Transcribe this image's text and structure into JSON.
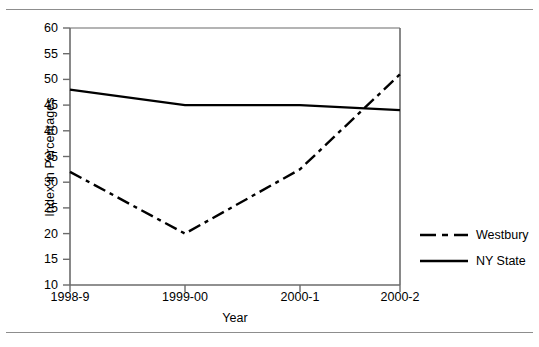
{
  "chart_data": {
    "type": "line",
    "title": "",
    "xlabel": "Year",
    "ylabel": "Index in Percentages",
    "categories": [
      "1998-9",
      "1999-00",
      "2000-1",
      "2000-2"
    ],
    "ylim": [
      10,
      60
    ],
    "yticks": [
      10,
      15,
      20,
      25,
      30,
      35,
      40,
      45,
      50,
      55,
      60
    ],
    "grid": false,
    "legend_position": "right",
    "series": [
      {
        "name": "Westbury",
        "style": "dash-dot",
        "color": "#000000",
        "values": [
          32,
          20,
          32.5,
          51
        ]
      },
      {
        "name": "NY State",
        "style": "solid",
        "color": "#000000",
        "values": [
          48,
          45,
          45,
          44
        ]
      }
    ]
  },
  "axis": {
    "y_title": "Index in Percentages",
    "x_title": "Year",
    "y_tick_labels": [
      "60",
      "55",
      "50",
      "45",
      "40",
      "35",
      "30",
      "25",
      "20",
      "15",
      "10"
    ],
    "x_tick_labels": [
      "1998-9",
      "1999-00",
      "2000-1",
      "2000-2"
    ]
  },
  "legend": {
    "items": [
      {
        "label": "Westbury",
        "key": "dash-dot-line-key"
      },
      {
        "label": "NY State",
        "key": "solid-line-key"
      }
    ]
  },
  "colors": {
    "line": "#000000",
    "axis": "#6b6b6b",
    "rule": "#8d8d8d",
    "background": "#ffffff"
  }
}
